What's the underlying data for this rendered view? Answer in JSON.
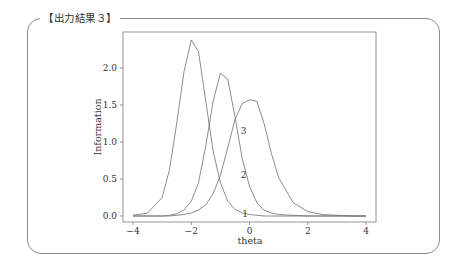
{
  "frame": {
    "title": "【出力結果３】"
  },
  "chart_data": {
    "type": "line",
    "title": "",
    "xlabel": "theta",
    "ylabel": "Information",
    "xlim": [
      -4,
      4
    ],
    "ylim": [
      0.0,
      2.4
    ],
    "xticks": [
      -4,
      -2,
      0,
      2,
      4
    ],
    "xtick_labels": [
      "−4",
      "−2",
      "0",
      "2",
      "4"
    ],
    "yticks": [
      0.0,
      0.5,
      1.0,
      1.5,
      2.0
    ],
    "ytick_labels": [
      "0.0",
      "0.5",
      "1.0",
      "1.5",
      "2.0"
    ],
    "grid": false,
    "legend": "none (inline curve labels 1, 2, 3)",
    "x": [
      -4.0,
      -3.5,
      -3.0,
      -2.75,
      -2.5,
      -2.25,
      -2.0,
      -1.75,
      -1.5,
      -1.25,
      -1.0,
      -0.75,
      -0.5,
      -0.25,
      0.0,
      0.25,
      0.5,
      0.75,
      1.0,
      1.5,
      2.0,
      2.5,
      3.0,
      3.5,
      4.0
    ],
    "series": [
      {
        "name": "1",
        "peak_theta": -2.0,
        "peak_value": 2.38,
        "values": [
          0.01,
          0.04,
          0.25,
          0.62,
          1.25,
          1.95,
          2.38,
          2.22,
          1.55,
          0.88,
          0.45,
          0.2,
          0.09,
          0.04,
          0.02,
          0.01,
          0.0,
          0.0,
          0.0,
          0.0,
          0.0,
          0.0,
          0.0,
          0.0,
          0.0
        ]
      },
      {
        "name": "2",
        "peak_theta": -1.0,
        "peak_value": 1.93,
        "values": [
          0.0,
          0.0,
          0.0,
          0.01,
          0.03,
          0.08,
          0.2,
          0.45,
          0.95,
          1.55,
          1.93,
          1.85,
          1.35,
          0.78,
          0.4,
          0.18,
          0.08,
          0.04,
          0.02,
          0.01,
          0.0,
          0.0,
          0.0,
          0.0,
          0.0
        ]
      },
      {
        "name": "3",
        "peak_theta": 0.1,
        "peak_value": 1.58,
        "values": [
          0.0,
          0.0,
          0.0,
          0.0,
          0.01,
          0.02,
          0.04,
          0.08,
          0.15,
          0.3,
          0.55,
          0.92,
          1.3,
          1.52,
          1.57,
          1.55,
          1.25,
          0.85,
          0.52,
          0.18,
          0.06,
          0.02,
          0.01,
          0.0,
          0.0
        ]
      }
    ],
    "annotations": [
      {
        "text": "1",
        "theta": -0.15,
        "value": 0.03
      },
      {
        "text": "2",
        "theta": -0.2,
        "value": 0.55
      },
      {
        "text": "3",
        "theta": -0.2,
        "value": 1.15
      }
    ]
  }
}
